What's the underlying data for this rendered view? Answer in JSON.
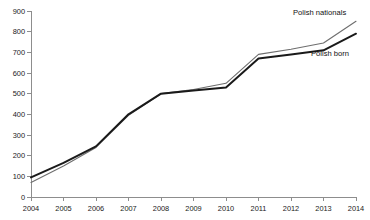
{
  "chart_data": {
    "type": "line",
    "title": "",
    "subtitle": "",
    "xlabel": "",
    "ylabel": "",
    "x": [
      2004,
      2005,
      2006,
      2007,
      2008,
      2009,
      2010,
      2011,
      2012,
      2013,
      2014
    ],
    "categories": [
      "2004",
      "2005",
      "2006",
      "2007",
      "2008",
      "2009",
      "2010",
      "2011",
      "2012",
      "2013",
      "2014"
    ],
    "series": [
      {
        "name": "Polish nationals",
        "values": [
          70,
          150,
          240,
          395,
          500,
          520,
          550,
          690,
          715,
          745,
          850
        ],
        "color": "#6e6e6e",
        "line_width": 1.1,
        "label_x": 2014,
        "label_value": 850
      },
      {
        "name": "Polish born",
        "values": [
          95,
          165,
          245,
          400,
          500,
          515,
          530,
          670,
          690,
          710,
          790
        ],
        "color": "#1a1a1a",
        "line_width": 2.0,
        "label_x": 2014,
        "label_value": 790
      }
    ],
    "ylim": [
      0,
      900
    ],
    "xlim": [
      2004,
      2014
    ],
    "y_ticks": [
      0,
      100,
      200,
      300,
      400,
      500,
      600,
      700,
      800,
      900
    ],
    "y_tick_labels": [
      "0",
      "100",
      "200",
      "300",
      "400",
      "500",
      "600",
      "700",
      "800",
      "900"
    ],
    "x_ticks": [
      2004,
      2005,
      2006,
      2007,
      2008,
      2009,
      2010,
      2011,
      2012,
      2013,
      2014
    ],
    "x_tick_labels": [
      "2004",
      "2005",
      "2006",
      "2007",
      "2008",
      "2009",
      "2010",
      "2011",
      "2012",
      "2013",
      "2014"
    ],
    "grid": false,
    "legend_position": "inline-end-labels",
    "background_color": "#ffffff",
    "axis_color": "#8d8d8d"
  },
  "labels": {
    "series_polish_nationals": "Polish nationals",
    "series_polish_born": "Polish born"
  }
}
